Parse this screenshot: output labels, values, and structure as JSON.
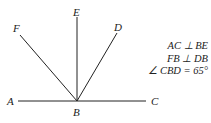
{
  "diagram": {
    "points": {
      "A": {
        "label": "A",
        "x": 12,
        "y": 101
      },
      "B": {
        "label": "B",
        "x": 77,
        "y": 101
      },
      "C": {
        "label": "C",
        "x": 154,
        "y": 101
      },
      "D": {
        "label": "D",
        "x": 117,
        "y": 28
      },
      "E": {
        "label": "E",
        "x": 77,
        "y": 12
      },
      "F": {
        "label": "F",
        "x": 16,
        "y": 30
      }
    },
    "given": [
      "AC ⊥ BE",
      "FB ⊥ DB",
      "∠ CBD = 65°"
    ],
    "line_color": "#222222"
  }
}
